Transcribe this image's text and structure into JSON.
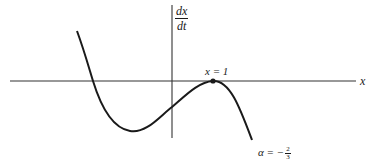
{
  "diagram": {
    "type": "function-plot",
    "axes": {
      "horizontal_label": "x",
      "vertical_label": {
        "numerator": "dx",
        "denominator": "dt"
      }
    },
    "annotations": {
      "point_label": "x = 1",
      "curve_label_prefix": "α = −",
      "curve_label_fraction": {
        "numerator": "2",
        "denominator": "3"
      }
    },
    "colors": {
      "stroke": "#1a1a1a",
      "axis": "#333333",
      "background": "#ffffff"
    }
  }
}
